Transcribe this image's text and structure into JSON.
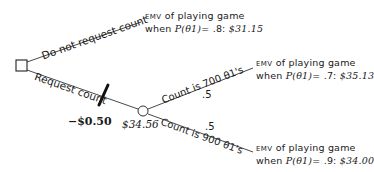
{
  "diagram": {
    "type": "decision-tree",
    "decision_node": {
      "shape": "square"
    },
    "branches": {
      "no_request": {
        "label": "Do not request count",
        "outcome": {
          "prefix": "EMV",
          "line1": "of playing game",
          "when": "when",
          "prob_expr": "P(θ1)",
          "prob_value": "= .8:",
          "value": "$31.15"
        }
      },
      "request": {
        "label": "Request count",
        "cost": "−$0.50",
        "chance_node": {
          "shape": "circle",
          "value": "$34.56"
        },
        "sub_branches": [
          {
            "label": "Count is 700 θ1's",
            "probability": ".5",
            "outcome": {
              "prefix": "EMV",
              "line1": "of playing game",
              "when": "when",
              "prob_expr": "P(θ1)",
              "prob_value": "= .7:",
              "value": "$35.13"
            }
          },
          {
            "label": "Count is 900 θ1's",
            "probability": ".5",
            "outcome": {
              "prefix": "EMV",
              "line1": "of playing game",
              "when": "when",
              "prob_expr": "P(θ1)",
              "prob_value": "= .9:",
              "value": "$34.00"
            }
          }
        ]
      }
    }
  }
}
